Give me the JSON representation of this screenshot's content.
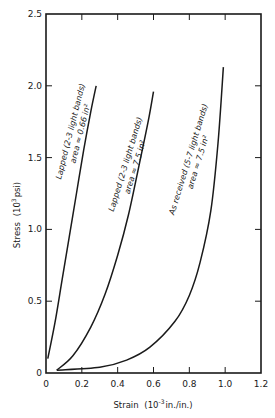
{
  "chart_data": {
    "type": "line",
    "title": "",
    "xlabel": "Strain (10^-3 in./in.)",
    "ylabel": "Stress (10^3 psi)",
    "xlim": [
      0,
      1.2
    ],
    "ylim": [
      0,
      2.5
    ],
    "x_ticks": [
      "0",
      "0.2",
      "0.4",
      "0.6",
      "0.8",
      "1.0",
      "1.2"
    ],
    "y_ticks": [
      "0",
      "0.5",
      "1.0",
      "1.5",
      "2.0",
      "2.5"
    ],
    "grid": false,
    "legend": "none (curves annotated inline)",
    "series": [
      {
        "name": "Lapped (2-3 light bands) area ≈ 0.66 in²",
        "label_line1": "Lapped (2-3 light bands)",
        "label_line2": "area ≈ 0.66 in²",
        "x": [
          0.01,
          0.05,
          0.09,
          0.13,
          0.17,
          0.21,
          0.25,
          0.28
        ],
        "y": [
          0.1,
          0.35,
          0.65,
          0.95,
          1.25,
          1.55,
          1.82,
          2.0
        ]
      },
      {
        "name": "Lapped (2-3 light bands) area ≈ 7.5 in²",
        "label_line1": "Lapped (2-3 light bands)",
        "label_line2": "area ≈ 7.5 in²",
        "x": [
          0.06,
          0.15,
          0.25,
          0.33,
          0.4,
          0.46,
          0.52,
          0.57,
          0.6
        ],
        "y": [
          0.02,
          0.12,
          0.32,
          0.55,
          0.82,
          1.1,
          1.45,
          1.75,
          1.96
        ]
      },
      {
        "name": "As received (5-7 light bands) area ≈ 7.5 in²",
        "label_line1": "As received (5-7 light bands)",
        "label_line2": "area ≈ 7.5 in²",
        "x": [
          0.06,
          0.3,
          0.45,
          0.58,
          0.72,
          0.8,
          0.86,
          0.92,
          0.96,
          0.99
        ],
        "y": [
          0.02,
          0.04,
          0.09,
          0.18,
          0.36,
          0.54,
          0.77,
          1.13,
          1.6,
          2.13
        ]
      }
    ]
  },
  "axes": {
    "x_label_main": "Strain",
    "x_label_units_pre": "(10",
    "x_label_exp": "-3",
    "x_label_units_post": "in./in.)",
    "y_label_main": "Stress",
    "y_label_units_pre": "(10",
    "y_label_exp": "3",
    "y_label_units_post": "psi)"
  },
  "colors": {
    "line": "#1a1a1a",
    "background": "#ffffff"
  }
}
